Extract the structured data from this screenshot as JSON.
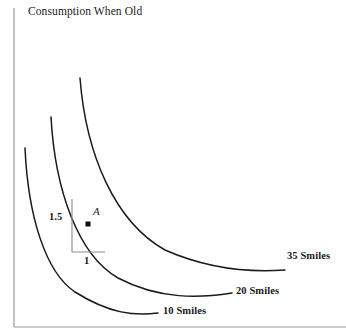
{
  "chart_data": {
    "type": "line",
    "title": "Consumption When Old",
    "xlabel": "",
    "ylabel": "Consumption When Old",
    "grid": false,
    "legend_position": "inline-right-of-curve",
    "series": [
      {
        "name": "10 Smiles",
        "utility": 10,
        "label": "10 Smiles",
        "label_x": 163,
        "label_y": 306,
        "path": "M 25,148 C 28,215 45,272 75,292 C 110,314 135,316 158,313",
        "points": [
          [
            25,
            148
          ],
          [
            33,
            205
          ],
          [
            48,
            255
          ],
          [
            75,
            292
          ],
          [
            115,
            312
          ],
          [
            158,
            313
          ]
        ]
      },
      {
        "name": "20 Smiles",
        "utility": 20,
        "label": "20 Smiles",
        "label_x": 236,
        "label_y": 286,
        "path": "M 51,117 C 55,190 78,255 118,278 C 160,300 200,298 232,293",
        "points": [
          [
            51,
            117
          ],
          [
            60,
            180
          ],
          [
            82,
            240
          ],
          [
            118,
            278
          ],
          [
            175,
            296
          ],
          [
            232,
            293
          ]
        ]
      },
      {
        "name": "35 Smiles",
        "utility": 35,
        "label": "35 Smiles",
        "label_x": 287,
        "label_y": 251,
        "path": "M 80,78 C 86,155 115,222 165,250 C 215,272 258,272 285,270",
        "points": [
          [
            80,
            78
          ],
          [
            92,
            145
          ],
          [
            120,
            210
          ],
          [
            165,
            250
          ],
          [
            228,
            271
          ],
          [
            285,
            270
          ]
        ]
      }
    ],
    "annotations": {
      "point": {
        "name": "A",
        "label": "A",
        "marker_x": 88,
        "marker_y": 224,
        "label_x": 93,
        "label_y": 206,
        "on_series": "20 Smiles"
      },
      "slope_triangle": {
        "vertical_leg_label": "1.5",
        "horizontal_leg_label": "1",
        "apex_x": 72,
        "apex_y": 199,
        "corner_x": 72,
        "corner_y": 252,
        "right_x": 105,
        "right_y": 252,
        "vertical_label_x": 49,
        "vertical_label_y": 212,
        "horizontal_label_x": 84,
        "horizontal_label_y": 256
      }
    },
    "axes": {
      "y_axis_x": 14,
      "y_axis_top": 8,
      "y_axis_bottom": 327,
      "x_axis_y": 327,
      "x_axis_left": 14,
      "x_axis_right": 346
    }
  },
  "colors": {
    "curve": "#1a1a1a",
    "axis": "#9a9a9a",
    "triangle": "#8c8c8c",
    "text": "#1a1a1a",
    "background": "#ffffff"
  }
}
